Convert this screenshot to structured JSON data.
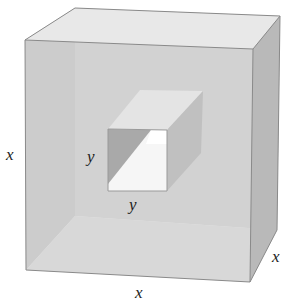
{
  "diagram": {
    "type": "cube-with-square-hole",
    "labels": {
      "cube_height": "x",
      "cube_width": "x",
      "cube_depth": "x",
      "hole_height": "y",
      "hole_width": "y"
    },
    "colors": {
      "front_face": "#cfcfcf",
      "top_face": "#e6e6e6",
      "right_face": "#b8b8b8",
      "interior_left": "#c6c6c6",
      "interior_floor": "#e2e2e2",
      "hole_left_wall": "#a9a9a9",
      "hole_right_wall": "#bcbcbc",
      "hole_top": "#e4e4e4",
      "hole_opening": "#f4f4f4",
      "edge": "#8a8a8a"
    }
  }
}
